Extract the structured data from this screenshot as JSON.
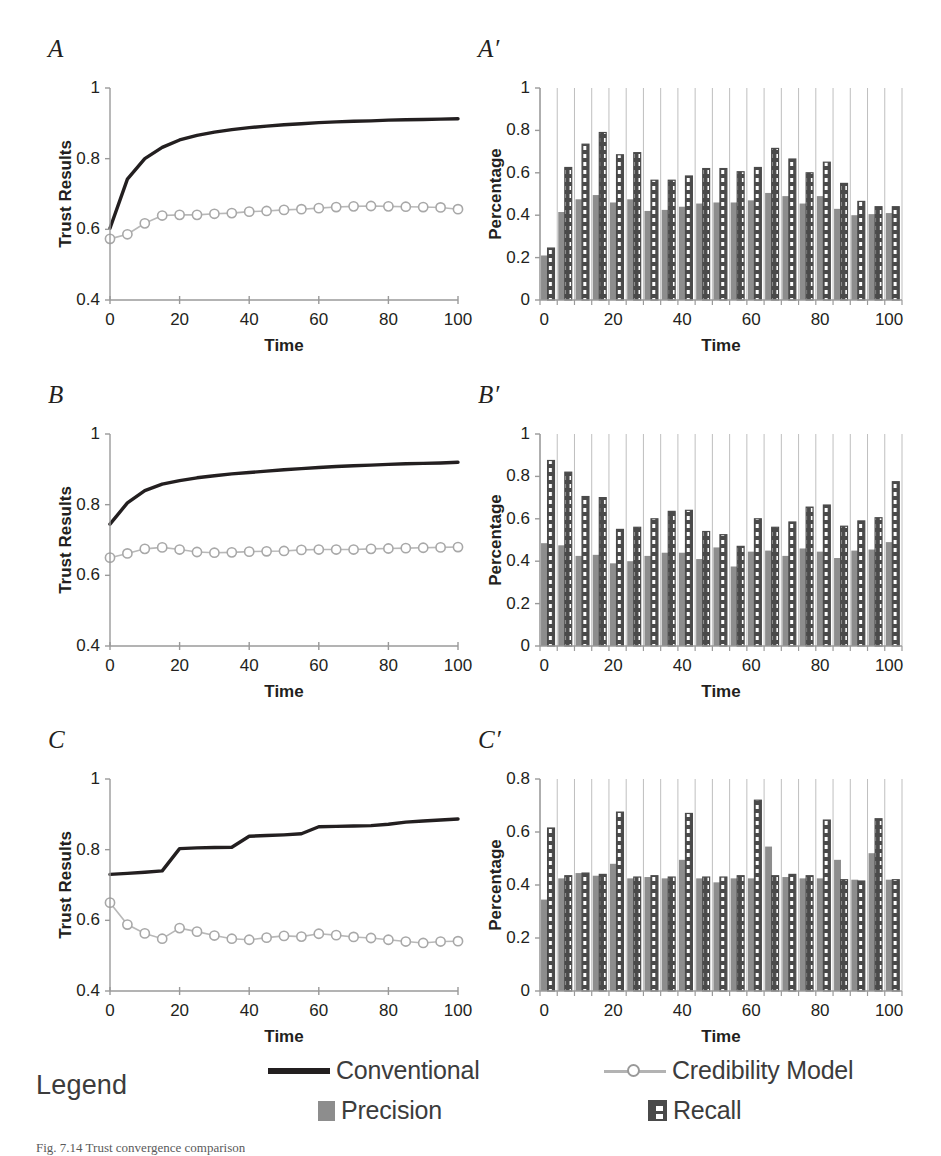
{
  "figure": {
    "panels": [
      {
        "id": "A",
        "label": "A",
        "type": "line",
        "ylabel": "Trust Results",
        "xlabel": "Time"
      },
      {
        "id": "Aprime",
        "label": "A′",
        "type": "bar",
        "ylabel": "Percentage",
        "xlabel": "Time"
      },
      {
        "id": "B",
        "label": "B",
        "type": "line",
        "ylabel": "Trust Results",
        "xlabel": "Time"
      },
      {
        "id": "Bprime",
        "label": "B′",
        "type": "bar",
        "ylabel": "Percentage",
        "xlabel": "Time"
      },
      {
        "id": "C",
        "label": "C",
        "type": "line",
        "ylabel": "Trust Results",
        "xlabel": "Time"
      },
      {
        "id": "Cprime",
        "label": "C′",
        "type": "bar",
        "ylabel": "Percentage",
        "xlabel": "Time"
      }
    ]
  },
  "legend": {
    "title": "Legend",
    "entries": [
      {
        "name": "conventional",
        "label": "Conventional",
        "swatch": "solid-line",
        "color": "#231f20"
      },
      {
        "name": "credibility-model",
        "label": "Credibility Model",
        "swatch": "line-circle-marker",
        "color": "#b3b3b3"
      },
      {
        "name": "precision",
        "label": "Precision",
        "swatch": "solid-square",
        "color": "#8d8d8d"
      },
      {
        "name": "recall",
        "label": "Recall",
        "swatch": "checkered-square",
        "color": "#4a4a4a"
      }
    ]
  },
  "caption": "Fig. 7.14  Trust convergence comparison",
  "chart_data": [
    {
      "id": "A",
      "type": "line",
      "title": "A",
      "xlabel": "Time",
      "ylabel": "Trust Results",
      "xlim": [
        0,
        100
      ],
      "ylim": [
        0.4,
        1
      ],
      "xticks": [
        0,
        20,
        40,
        60,
        80,
        100
      ],
      "yticks": [
        0.4,
        0.6,
        0.8,
        1
      ],
      "ytick_labels": [
        "0.4",
        "0.6",
        "0.8",
        "1"
      ],
      "grid": false,
      "legend": "external",
      "x": [
        0,
        5,
        10,
        15,
        20,
        25,
        30,
        35,
        40,
        45,
        50,
        55,
        60,
        65,
        70,
        75,
        80,
        85,
        90,
        95,
        100
      ],
      "series": [
        {
          "name": "Conventional",
          "marker": "none",
          "values": [
            0.603,
            0.742,
            0.8,
            0.832,
            0.853,
            0.866,
            0.875,
            0.882,
            0.888,
            0.892,
            0.896,
            0.899,
            0.902,
            0.904,
            0.906,
            0.907,
            0.909,
            0.91,
            0.911,
            0.912,
            0.913
          ]
        },
        {
          "name": "Credibility Model",
          "marker": "circle",
          "values": [
            0.573,
            0.586,
            0.617,
            0.639,
            0.641,
            0.641,
            0.644,
            0.646,
            0.65,
            0.652,
            0.655,
            0.657,
            0.66,
            0.663,
            0.665,
            0.666,
            0.665,
            0.664,
            0.663,
            0.662,
            0.657
          ]
        }
      ]
    },
    {
      "id": "Aprime",
      "type": "bar",
      "title": "A′",
      "xlabel": "Time",
      "ylabel": "Percentage",
      "xlim": [
        0,
        100
      ],
      "ylim": [
        0,
        1
      ],
      "xticks": [
        0,
        20,
        40,
        60,
        80,
        100
      ],
      "yticks": [
        0,
        0.2,
        0.4,
        0.6,
        0.8,
        1
      ],
      "ytick_labels": [
        "0",
        "0.2",
        "0.4",
        "0.6",
        "0.8",
        "1"
      ],
      "grid": true,
      "categories": [
        0,
        5,
        10,
        15,
        20,
        25,
        30,
        35,
        40,
        45,
        50,
        55,
        60,
        65,
        70,
        75,
        80,
        85,
        90,
        95,
        100
      ],
      "series": [
        {
          "name": "Precision",
          "values": [
            0.21,
            0.415,
            0.475,
            0.495,
            0.46,
            0.475,
            0.42,
            0.425,
            0.44,
            0.455,
            0.46,
            0.46,
            0.47,
            0.505,
            0.49,
            0.455,
            0.49,
            0.43,
            0.4,
            0.405,
            0.41
          ]
        },
        {
          "name": "Recall",
          "values": [
            0.245,
            0.625,
            0.735,
            0.79,
            0.685,
            0.695,
            0.565,
            0.565,
            0.585,
            0.62,
            0.62,
            0.605,
            0.625,
            0.715,
            0.665,
            0.6,
            0.65,
            0.55,
            0.465,
            0.44,
            0.44
          ]
        }
      ]
    },
    {
      "id": "B",
      "type": "line",
      "title": "B",
      "xlabel": "Time",
      "ylabel": "Trust Results",
      "xlim": [
        0,
        100
      ],
      "ylim": [
        0.4,
        1
      ],
      "xticks": [
        0,
        20,
        40,
        60,
        80,
        100
      ],
      "yticks": [
        0.4,
        0.6,
        0.8,
        1
      ],
      "ytick_labels": [
        "0.4",
        "0.6",
        "0.8",
        "1"
      ],
      "grid": false,
      "x": [
        0,
        5,
        10,
        15,
        20,
        25,
        30,
        35,
        40,
        45,
        50,
        55,
        60,
        65,
        70,
        75,
        80,
        85,
        90,
        95,
        100
      ],
      "series": [
        {
          "name": "Conventional",
          "marker": "none",
          "values": [
            0.745,
            0.805,
            0.84,
            0.858,
            0.868,
            0.876,
            0.882,
            0.887,
            0.891,
            0.895,
            0.899,
            0.902,
            0.905,
            0.908,
            0.91,
            0.912,
            0.914,
            0.916,
            0.917,
            0.918,
            0.92
          ]
        },
        {
          "name": "Credibility Model",
          "marker": "circle",
          "values": [
            0.65,
            0.662,
            0.675,
            0.679,
            0.673,
            0.666,
            0.664,
            0.665,
            0.667,
            0.668,
            0.669,
            0.672,
            0.673,
            0.673,
            0.673,
            0.675,
            0.676,
            0.677,
            0.678,
            0.679,
            0.68
          ]
        }
      ]
    },
    {
      "id": "Bprime",
      "type": "bar",
      "title": "B′",
      "xlabel": "Time",
      "ylabel": "Percentage",
      "xlim": [
        0,
        100
      ],
      "ylim": [
        0,
        1
      ],
      "xticks": [
        0,
        20,
        40,
        60,
        80,
        100
      ],
      "yticks": [
        0,
        0.2,
        0.4,
        0.6,
        0.8,
        1
      ],
      "ytick_labels": [
        "0",
        "0.2",
        "0.4",
        "0.6",
        "0.8",
        "1"
      ],
      "grid": true,
      "categories": [
        0,
        5,
        10,
        15,
        20,
        25,
        30,
        35,
        40,
        45,
        50,
        55,
        60,
        65,
        70,
        75,
        80,
        85,
        90,
        95,
        100
      ],
      "series": [
        {
          "name": "Precision",
          "values": [
            0.485,
            0.475,
            0.425,
            0.43,
            0.39,
            0.4,
            0.425,
            0.44,
            0.44,
            0.41,
            0.465,
            0.375,
            0.445,
            0.45,
            0.425,
            0.46,
            0.445,
            0.415,
            0.45,
            0.455,
            0.49
          ]
        },
        {
          "name": "Recall",
          "values": [
            0.875,
            0.82,
            0.705,
            0.7,
            0.55,
            0.56,
            0.6,
            0.635,
            0.64,
            0.54,
            0.525,
            0.47,
            0.6,
            0.56,
            0.585,
            0.655,
            0.665,
            0.565,
            0.59,
            0.605,
            0.775
          ]
        }
      ]
    },
    {
      "id": "C",
      "type": "line",
      "title": "C",
      "xlabel": "Time",
      "ylabel": "Trust Results",
      "xlim": [
        0,
        100
      ],
      "ylim": [
        0.4,
        1
      ],
      "xticks": [
        0,
        20,
        40,
        60,
        80,
        100
      ],
      "yticks": [
        0.4,
        0.6,
        0.8,
        1
      ],
      "ytick_labels": [
        "0.4",
        "0.6",
        "0.8",
        "1"
      ],
      "grid": false,
      "x": [
        0,
        5,
        10,
        15,
        20,
        25,
        30,
        35,
        40,
        45,
        50,
        55,
        60,
        65,
        70,
        75,
        80,
        85,
        90,
        95,
        100
      ],
      "series": [
        {
          "name": "Conventional",
          "marker": "none",
          "values": [
            0.73,
            0.733,
            0.736,
            0.74,
            0.803,
            0.805,
            0.806,
            0.807,
            0.838,
            0.84,
            0.842,
            0.845,
            0.865,
            0.866,
            0.867,
            0.868,
            0.872,
            0.878,
            0.881,
            0.884,
            0.887
          ]
        },
        {
          "name": "Credibility Model",
          "marker": "circle",
          "values": [
            0.65,
            0.588,
            0.563,
            0.548,
            0.578,
            0.568,
            0.557,
            0.548,
            0.545,
            0.551,
            0.556,
            0.554,
            0.562,
            0.558,
            0.553,
            0.55,
            0.545,
            0.54,
            0.536,
            0.54,
            0.541
          ]
        }
      ]
    },
    {
      "id": "Cprime",
      "type": "bar",
      "title": "C′",
      "xlabel": "Time",
      "ylabel": "Percentage",
      "xlim": [
        0,
        100
      ],
      "ylim": [
        0,
        0.8
      ],
      "xticks": [
        0,
        20,
        40,
        60,
        80,
        100
      ],
      "yticks": [
        0,
        0.2,
        0.4,
        0.6,
        0.8
      ],
      "ytick_labels": [
        "0",
        "0.2",
        "0.4",
        "0.6",
        "0.8"
      ],
      "grid": true,
      "categories": [
        0,
        5,
        10,
        15,
        20,
        25,
        30,
        35,
        40,
        45,
        50,
        55,
        60,
        65,
        70,
        75,
        80,
        85,
        90,
        95,
        100
      ],
      "series": [
        {
          "name": "Precision",
          "values": [
            0.345,
            0.425,
            0.445,
            0.435,
            0.48,
            0.425,
            0.43,
            0.425,
            0.495,
            0.425,
            0.41,
            0.425,
            0.425,
            0.545,
            0.43,
            0.425,
            0.425,
            0.495,
            0.42,
            0.52,
            0.42
          ]
        },
        {
          "name": "Recall",
          "values": [
            0.615,
            0.435,
            0.445,
            0.44,
            0.675,
            0.43,
            0.435,
            0.43,
            0.67,
            0.43,
            0.43,
            0.435,
            0.72,
            0.435,
            0.44,
            0.435,
            0.645,
            0.42,
            0.415,
            0.65,
            0.42
          ]
        }
      ]
    }
  ]
}
